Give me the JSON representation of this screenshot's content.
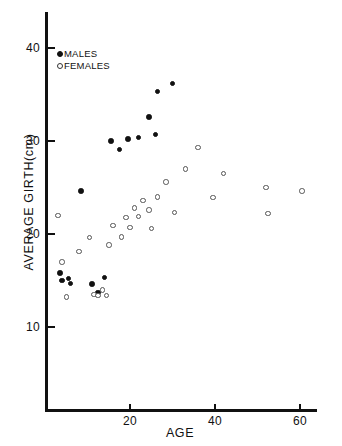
{
  "chart_data": {
    "type": "scatter",
    "title": "",
    "xlabel": "AGE",
    "ylabel": "AVERAGE GIRTH(cm)",
    "xlim": [
      0,
      64
    ],
    "ylim": [
      0,
      43
    ],
    "xticks": [
      20,
      40,
      60
    ],
    "yticks": [
      10,
      20,
      30,
      40
    ],
    "grid": false,
    "legend_position": "top-left inside axes",
    "series": [
      {
        "name": "MALES",
        "marker": "filled-circle",
        "color": "#111111",
        "points": [
          {
            "x": 3.5,
            "y": 15.8
          },
          {
            "x": 4.0,
            "y": 15.0
          },
          {
            "x": 5.5,
            "y": 15.2
          },
          {
            "x": 6.0,
            "y": 14.7
          },
          {
            "x": 8.5,
            "y": 24.6
          },
          {
            "x": 11.0,
            "y": 14.6
          },
          {
            "x": 12.5,
            "y": 13.7
          },
          {
            "x": 14.0,
            "y": 15.3
          },
          {
            "x": 15.5,
            "y": 30.0
          },
          {
            "x": 17.5,
            "y": 29.1
          },
          {
            "x": 19.5,
            "y": 30.2
          },
          {
            "x": 22.0,
            "y": 30.4
          },
          {
            "x": 24.5,
            "y": 32.6
          },
          {
            "x": 26.0,
            "y": 30.7
          },
          {
            "x": 26.5,
            "y": 35.3
          },
          {
            "x": 30.0,
            "y": 36.2
          }
        ]
      },
      {
        "name": "FEMALES",
        "marker": "open-circle",
        "color": "#555555",
        "points": [
          {
            "x": 3.0,
            "y": 22.0
          },
          {
            "x": 4.0,
            "y": 17.0
          },
          {
            "x": 5.0,
            "y": 13.2
          },
          {
            "x": 8.0,
            "y": 18.1
          },
          {
            "x": 10.5,
            "y": 19.6
          },
          {
            "x": 11.5,
            "y": 13.5
          },
          {
            "x": 12.5,
            "y": 13.4
          },
          {
            "x": 13.5,
            "y": 14.0
          },
          {
            "x": 14.5,
            "y": 13.4
          },
          {
            "x": 15.0,
            "y": 18.8
          },
          {
            "x": 16.0,
            "y": 20.9
          },
          {
            "x": 18.0,
            "y": 19.7
          },
          {
            "x": 19.0,
            "y": 21.8
          },
          {
            "x": 20.0,
            "y": 20.7
          },
          {
            "x": 21.0,
            "y": 22.8
          },
          {
            "x": 22.0,
            "y": 21.9
          },
          {
            "x": 23.0,
            "y": 23.6
          },
          {
            "x": 24.5,
            "y": 22.6
          },
          {
            "x": 25.0,
            "y": 20.6
          },
          {
            "x": 26.5,
            "y": 24.0
          },
          {
            "x": 28.5,
            "y": 25.6
          },
          {
            "x": 30.5,
            "y": 22.3
          },
          {
            "x": 33.0,
            "y": 27.0
          },
          {
            "x": 36.0,
            "y": 29.3
          },
          {
            "x": 39.5,
            "y": 23.9
          },
          {
            "x": 42.0,
            "y": 26.5
          },
          {
            "x": 52.0,
            "y": 25.0
          },
          {
            "x": 52.5,
            "y": 22.2
          },
          {
            "x": 60.5,
            "y": 24.6
          }
        ]
      }
    ]
  },
  "legend": {
    "males_label": "MALES",
    "females_label": "FEMALES"
  },
  "axes": {
    "y_title": "AVERAGE GIRTH(cm)",
    "x_title": "AGE",
    "y_tick_labels": [
      "10",
      "20",
      "30",
      "40"
    ],
    "x_tick_labels": [
      "20",
      "40",
      "60"
    ]
  }
}
